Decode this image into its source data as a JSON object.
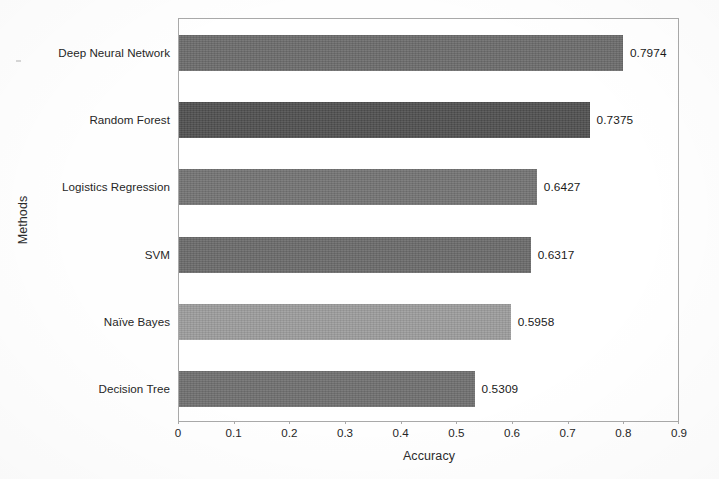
{
  "chart_data": {
    "type": "bar",
    "orientation": "horizontal",
    "title": "",
    "xlabel": "Accuracy",
    "ylabel": "Methods",
    "categories": [
      "Deep Neural Network",
      "Random Forest",
      "Logistics Regression",
      "SVM",
      "Naïve Bayes",
      "Decision Tree"
    ],
    "values": [
      0.7974,
      0.7375,
      0.6427,
      0.6317,
      0.5958,
      0.5309
    ],
    "value_labels": [
      "0.7974",
      "0.7375",
      "0.6427",
      "0.6317",
      "0.5958",
      "0.5309"
    ],
    "bar_colors": [
      "#6b6b6b",
      "#4f4f4f",
      "#737373",
      "#6a6a6a",
      "#9c9c9c",
      "#6f6f6f"
    ],
    "xlim": [
      0,
      0.9
    ],
    "xticks": [
      0,
      0.1,
      0.2,
      0.3,
      0.4,
      0.5,
      0.6,
      0.7,
      0.8,
      0.9
    ],
    "xtick_labels": [
      "0",
      "0.1",
      "0.2",
      "0.3",
      "0.4",
      "0.5",
      "0.6",
      "0.7",
      "0.8",
      "0.9"
    ],
    "grid": false,
    "legend": false,
    "legend_position": "none",
    "frame": true,
    "frame_color": "#a9a9a9",
    "background": "#ffffff"
  }
}
